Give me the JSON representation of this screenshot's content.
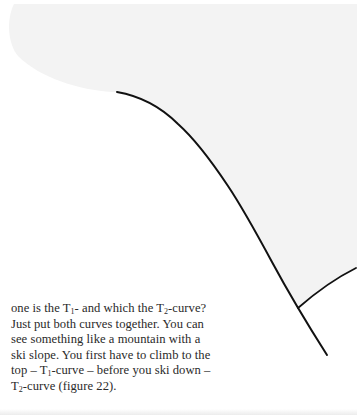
{
  "figure": {
    "shaded_region_color": "#f3f3f3",
    "curve_color": "#111111",
    "curves": [
      {
        "name": "T1-curve",
        "start": [
          117,
          92
        ],
        "end": [
          327,
          355
        ]
      },
      {
        "name": "T2-curve",
        "start": [
          298,
          308
        ],
        "end": [
          356,
          268
        ]
      }
    ]
  },
  "text": {
    "lines": [
      {
        "parts": [
          {
            "t": "one is the T"
          },
          {
            "sub": "1"
          },
          {
            "t": "- and which the T"
          },
          {
            "sub": "2"
          },
          {
            "t": "-curve?"
          }
        ]
      },
      {
        "parts": [
          {
            "t": "Just put both curves together. You can"
          }
        ]
      },
      {
        "parts": [
          {
            "t": "see something like a mountain with a"
          }
        ]
      },
      {
        "parts": [
          {
            "t": "ski slope. You first have to climb to the"
          }
        ]
      },
      {
        "parts": [
          {
            "t": "top – T"
          },
          {
            "sub": "1"
          },
          {
            "t": "-curve – before you ski down –"
          }
        ]
      },
      {
        "parts": [
          {
            "t": "T"
          },
          {
            "sub": "2"
          },
          {
            "t": "-curve (figure 22)."
          }
        ]
      }
    ]
  }
}
